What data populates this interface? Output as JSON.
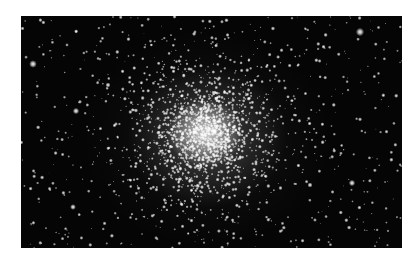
{
  "image": {
    "subject": "globular star cluster",
    "background_color": "#050505",
    "star_color": "#ffffff",
    "page_background": "#ffffff",
    "frame": {
      "left": 21,
      "top": 16,
      "width": 381,
      "height": 232
    },
    "core_center": {
      "x": 184,
      "y": 117
    },
    "bright_field_stars": [
      {
        "x": 339,
        "y": 16,
        "r": 2.6
      },
      {
        "x": 12,
        "y": 48,
        "r": 2.4
      },
      {
        "x": 55,
        "y": 95,
        "r": 2.0
      },
      {
        "x": 331,
        "y": 167,
        "r": 2.0
      },
      {
        "x": 52,
        "y": 191,
        "r": 1.8
      },
      {
        "x": 289,
        "y": 169,
        "r": 1.6
      },
      {
        "x": 87,
        "y": 69,
        "r": 1.6
      }
    ]
  }
}
